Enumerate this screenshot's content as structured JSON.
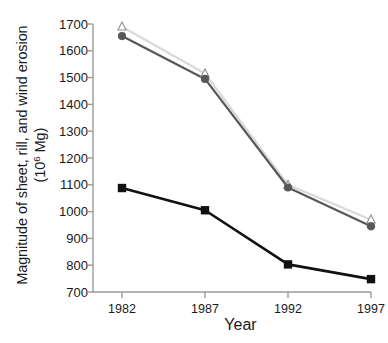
{
  "chart_data": {
    "type": "line",
    "title": "",
    "xlabel": "Year",
    "ylabel": "Magnitude of sheet, rill, and wind erosion (10⁶ Mg)",
    "ylabel_line1": "Magnitude of sheet, rill, and wind erosion",
    "ylabel_line2_pre": "(10",
    "ylabel_line2_sup": "6",
    "ylabel_line2_post": " Mg)",
    "categories": [
      "1982",
      "1987",
      "1992",
      "1997"
    ],
    "x": [
      1982,
      1987,
      1992,
      1997
    ],
    "xlim": [
      1980,
      1999
    ],
    "ylim": [
      700,
      1700
    ],
    "yticks": [
      700,
      800,
      900,
      1000,
      1100,
      1200,
      1300,
      1400,
      1500,
      1600,
      1700
    ],
    "ytick_labels": [
      "700",
      "800",
      "900",
      "1000",
      "1100",
      "1200",
      "1300",
      "1400",
      "1500",
      "1600",
      "1700"
    ],
    "grid": false,
    "legend": "none",
    "series": [
      {
        "name": "light-gray-triangle-series",
        "marker": "triangle-open",
        "color": "#d9d9d9",
        "marker_color": "#bfbfbf",
        "values": [
          1690,
          1515,
          1100,
          970
        ]
      },
      {
        "name": "dark-gray-circle-series",
        "marker": "circle-filled",
        "color": "#585858",
        "marker_color": "#585858",
        "values": [
          1655,
          1495,
          1090,
          945
        ]
      },
      {
        "name": "black-square-series",
        "marker": "square-filled",
        "color": "#111111",
        "marker_color": "#111111",
        "values": [
          1088,
          1005,
          803,
          748
        ]
      }
    ],
    "axis_color": "#9a9a9a"
  }
}
